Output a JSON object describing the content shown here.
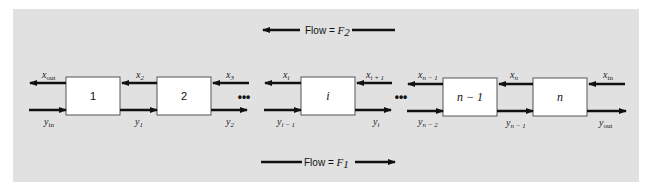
{
  "diagram": {
    "type": "countercurrent multistage process",
    "flow_top": {
      "label": "Flow = ",
      "symbol": "F",
      "subscript": "2",
      "direction": "left"
    },
    "flow_bottom": {
      "label": "Flow = ",
      "symbol": "F",
      "subscript": "1",
      "direction": "right"
    },
    "stages": [
      {
        "label": "1",
        "italic": false
      },
      {
        "label": "2",
        "italic": false
      },
      {
        "label": "i",
        "italic": true
      },
      {
        "label": "n − 1",
        "italic": true
      },
      {
        "label": "n",
        "italic": true
      }
    ],
    "ellipsis": "•••",
    "x_labels": [
      {
        "base": "x",
        "sub": "out"
      },
      {
        "base": "x",
        "sub": "2"
      },
      {
        "base": "x",
        "sub": "3"
      },
      {
        "base": "x",
        "sub": "i"
      },
      {
        "base": "x",
        "sub": "i + 1"
      },
      {
        "base": "x",
        "sub": "n − 1"
      },
      {
        "base": "x",
        "sub": "n"
      },
      {
        "base": "x",
        "sub": "in"
      }
    ],
    "y_labels": [
      {
        "base": "y",
        "sub": "in"
      },
      {
        "base": "y",
        "sub": "1"
      },
      {
        "base": "y",
        "sub": "2"
      },
      {
        "base": "y",
        "sub": "i − 1"
      },
      {
        "base": "y",
        "sub": "i"
      },
      {
        "base": "y",
        "sub": "n − 2"
      },
      {
        "base": "y",
        "sub": "n − 1"
      },
      {
        "base": "y",
        "sub": "out"
      }
    ],
    "colors": {
      "panel": "#e1e1e1",
      "box": "#ffffff",
      "line": "#111111"
    }
  }
}
